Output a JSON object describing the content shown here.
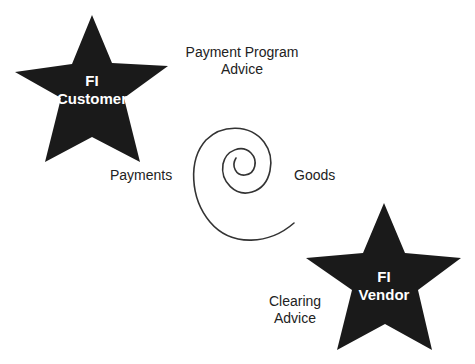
{
  "diagram": {
    "nodes": [
      {
        "id": "customer",
        "shape": "star",
        "line1": "FI",
        "line2": "Customer",
        "fill": "#1a1a1a",
        "text_color": "#ffffff"
      },
      {
        "id": "vendor",
        "shape": "star",
        "line1": "FI",
        "line2": "Vendor",
        "fill": "#1a1a1a",
        "text_color": "#ffffff"
      }
    ],
    "connector": {
      "shape": "spiral",
      "stroke": "#333333"
    },
    "labels": {
      "payment_program_line1": "Payment Program",
      "payment_program_line2": "Advice",
      "payments": "Payments",
      "goods": "Goods",
      "clearing_line1": "Clearing",
      "clearing_line2": "Advice"
    }
  }
}
